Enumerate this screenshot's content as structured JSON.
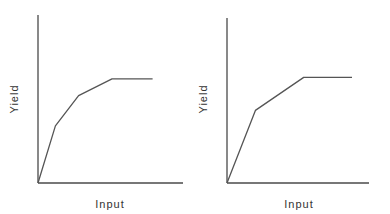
{
  "chart_data": [
    {
      "type": "line",
      "title": "",
      "xlabel": "Input",
      "ylabel": "Yield",
      "xlim": [
        0,
        1
      ],
      "ylim": [
        0,
        1
      ],
      "grid": false,
      "ticks": "none",
      "series": [
        {
          "name": "yield-curve",
          "x": [
            0,
            0.12,
            0.28,
            0.51,
            0.79
          ],
          "y": [
            0,
            0.34,
            0.52,
            0.62,
            0.62
          ]
        }
      ]
    },
    {
      "type": "line",
      "title": "",
      "xlabel": "Input",
      "ylabel": "Yield",
      "xlim": [
        0,
        1
      ],
      "ylim": [
        0,
        1
      ],
      "grid": false,
      "ticks": "none",
      "series": [
        {
          "name": "yield-curve",
          "x": [
            0,
            0.2,
            0.54,
            0.88
          ],
          "y": [
            0,
            0.44,
            0.64,
            0.64
          ]
        }
      ]
    }
  ],
  "colors": {
    "axis": "#4a4a4a",
    "line": "#555555",
    "background": "#ffffff"
  }
}
